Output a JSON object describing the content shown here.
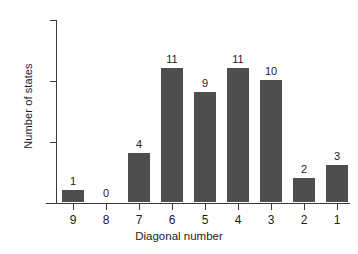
{
  "chart_data": {
    "type": "bar",
    "title": "",
    "xlabel": "Diagonal number",
    "ylabel": "Number of states",
    "categories": [
      "9",
      "8",
      "7",
      "6",
      "5",
      "4",
      "3",
      "2",
      "1"
    ],
    "values": [
      1,
      0,
      4,
      11,
      9,
      11,
      10,
      2,
      3
    ],
    "value_labels": [
      "1",
      "0",
      "4",
      "11",
      "9",
      "11",
      "10",
      "2",
      "3"
    ],
    "ylim": [
      0,
      15
    ],
    "yticks": [
      0,
      5,
      10,
      15
    ],
    "ytick_labels": [
      "0",
      "5",
      "10",
      "15"
    ],
    "grid": false,
    "legend": "none",
    "bar_color": "#4e4e4e",
    "axis_color": "#3a3a3a",
    "background_color": "#ffffff"
  }
}
